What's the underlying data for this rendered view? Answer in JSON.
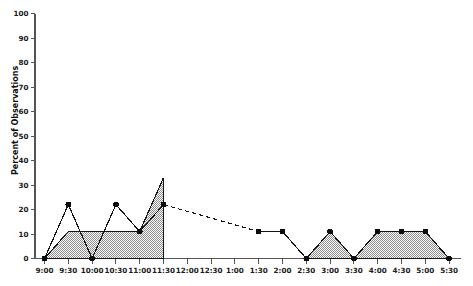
{
  "chart_data": {
    "type": "area",
    "title": "",
    "subtitle": "",
    "xlabel": "",
    "ylabel": "Percent of Observations",
    "ylim": [
      0,
      100
    ],
    "ytick_step": 10,
    "ytick_labels": [
      "0",
      "10",
      "20",
      "30",
      "40",
      "50",
      "60",
      "70",
      "80",
      "90",
      "100"
    ],
    "ytick_values": [
      0,
      10,
      20,
      30,
      40,
      50,
      60,
      70,
      80,
      90,
      100
    ],
    "categories": [
      "9:00",
      "9:30",
      "10:00",
      "10:30",
      "11:00",
      "11:30",
      "12:00",
      "12:30",
      "1:00",
      "1:30",
      "2:00",
      "2:30",
      "3:00",
      "3:30",
      "4:00",
      "4:30",
      "5:00",
      "5:30"
    ],
    "grid": false,
    "legend": "none",
    "legend_position": "none",
    "annotations": [
      "Dashed segment spans 11:30 to 1:30 indicating interpolated / unobserved interval"
    ],
    "series": [
      {
        "name": "Percent of Observations (marker line)",
        "style": "line-with-markers",
        "marker": "filled-circle",
        "color": "#141414",
        "values": [
          0,
          22,
          0,
          22,
          11,
          22,
          null,
          null,
          null,
          11,
          11,
          0,
          11,
          0,
          11,
          11,
          11,
          0
        ]
      },
      {
        "name": "Percent of Observations (shaded area)",
        "style": "filled-area",
        "fill": "gray-50-dither",
        "color": "#141414",
        "values": [
          0,
          11,
          11,
          11,
          11,
          33,
          null,
          null,
          null,
          null,
          null,
          0,
          11,
          0,
          11,
          11,
          11,
          0
        ]
      }
    ],
    "dashed_segment": {
      "from_category": "11:30",
      "from_value": 22,
      "to_category": "1:30",
      "to_value": 11
    },
    "colors": {
      "line": "#141414",
      "marker": "#0d0d0d",
      "area_fill": "#a8a8a8",
      "axis": "#555555",
      "background": "#ffffff"
    }
  }
}
